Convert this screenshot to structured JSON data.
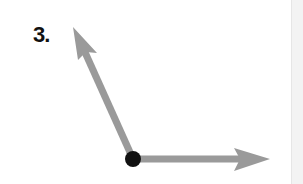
{
  "problem": {
    "label": "3."
  },
  "diagram": {
    "type": "angle",
    "vertex": {
      "x": 133,
      "y": 159
    },
    "ray_up": {
      "tip": {
        "x": 73,
        "y": 27
      }
    },
    "ray_right": {
      "tip": {
        "x": 270,
        "y": 159
      }
    },
    "colors": {
      "ray": "#9a9a9a",
      "vertex": "#111111"
    }
  }
}
